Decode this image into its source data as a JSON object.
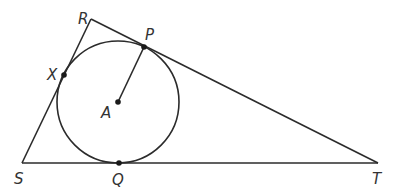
{
  "diagram": {
    "type": "triangle with inscribed circle",
    "stroke_color": "#2b2b2b",
    "triangle": {
      "vertices": [
        {
          "name": "R",
          "x": 91,
          "y": 19,
          "label_x": 78,
          "label_y": 24
        },
        {
          "name": "S",
          "x": 22,
          "y": 163,
          "label_x": 14,
          "label_y": 184
        },
        {
          "name": "T",
          "x": 378,
          "y": 163,
          "label_x": 372,
          "label_y": 184
        }
      ]
    },
    "circle": {
      "center": {
        "name": "A",
        "x": 118,
        "y": 102,
        "label_x": 101,
        "label_y": 118
      },
      "radius": 61
    },
    "tangent_points": [
      {
        "name": "P",
        "x": 144,
        "y": 47,
        "label_x": 145,
        "label_y": 40,
        "on_side": "RT"
      },
      {
        "name": "X",
        "x": 64,
        "y": 75,
        "label_x": 47,
        "label_y": 80,
        "on_side": "RS"
      },
      {
        "name": "Q",
        "x": 119,
        "y": 163,
        "label_x": 112,
        "label_y": 185,
        "on_side": "ST"
      }
    ],
    "segments": [
      {
        "name": "RS",
        "from": "R",
        "to": "S"
      },
      {
        "name": "RT",
        "from": "R",
        "to": "T"
      },
      {
        "name": "ST",
        "from": "S",
        "to": "T"
      },
      {
        "name": "AP",
        "from": "A",
        "to": "P",
        "role": "radius"
      }
    ],
    "labels": {
      "R": "R",
      "S": "S",
      "T": "T",
      "P": "P",
      "X": "X",
      "Q": "Q",
      "A": "A"
    }
  }
}
